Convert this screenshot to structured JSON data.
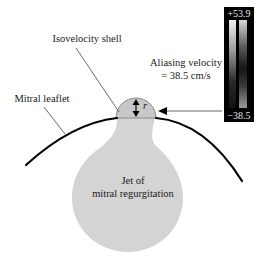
{
  "labels": {
    "isovelocity_shell": "Isovelocity shell",
    "aliasing_velocity_line1": "Aliasing velocity",
    "aliasing_velocity_line2": "= 38.5 cm/s",
    "mitral_leaflet": "Mitral leaflet",
    "jet_line1": "Jet of",
    "jet_line2": "mitral regurgitation",
    "radius": "r"
  },
  "colorbar": {
    "max_label": "+53.9",
    "min_label": "−38.5"
  },
  "colors": {
    "jet_fill": "#d4d4d4",
    "leaflet_stroke": "#000000",
    "colorbar_bg": "#000000",
    "text": "#1a1a1a"
  }
}
